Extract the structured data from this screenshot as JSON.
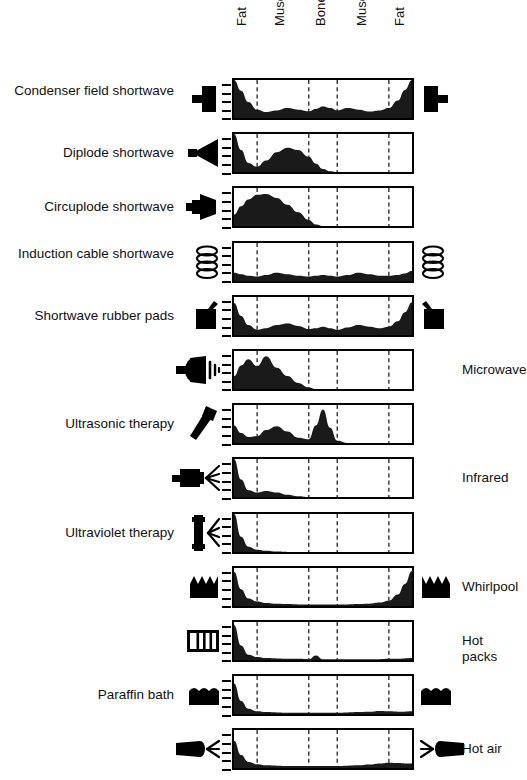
{
  "figure": {
    "axis_note": "depth-profile boxes with fat / muscle / bone / muscle / fat layers"
  },
  "tissue_layers": [
    {
      "label": "Fat",
      "start_pct": 0,
      "end_pct": 13
    },
    {
      "label": "Muscle",
      "start_pct": 13,
      "end_pct": 42
    },
    {
      "label": "Bone",
      "start_pct": 42,
      "end_pct": 58
    },
    {
      "label": "Muscle",
      "start_pct": 58,
      "end_pct": 87
    },
    {
      "label": "Fat",
      "start_pct": 87,
      "end_pct": 100
    }
  ],
  "colors": {
    "ink": "#000000",
    "fill": "#1a1a1a",
    "background": "#ffffff",
    "divider": "#333333"
  },
  "chart_data": {
    "type": "area",
    "xlabel": "Tissue depth (fat / muscle / bone / muscle / fat)",
    "ylabel": "Relative energy absorption",
    "xlim": [
      0,
      100
    ],
    "ylim": [
      0,
      1
    ],
    "grid": false,
    "legend_position": "none",
    "dividers_pct": [
      13,
      42,
      58,
      87
    ],
    "x": [
      0,
      4,
      8,
      13,
      18,
      24,
      30,
      36,
      42,
      46,
      50,
      54,
      58,
      64,
      70,
      76,
      82,
      87,
      92,
      96,
      100
    ],
    "series": [
      {
        "name": "Condenser field shortwave",
        "label_side": "left",
        "icon": "condenser-plate-icon",
        "icon_both_sides": true,
        "values": [
          1.0,
          0.72,
          0.42,
          0.22,
          0.16,
          0.2,
          0.26,
          0.22,
          0.18,
          0.24,
          0.3,
          0.26,
          0.2,
          0.26,
          0.22,
          0.17,
          0.2,
          0.26,
          0.46,
          0.74,
          1.0
        ]
      },
      {
        "name": "Diplode shortwave",
        "label_side": "left",
        "icon": "diplode-icon",
        "icon_both_sides": false,
        "values": [
          1.0,
          0.58,
          0.24,
          0.14,
          0.3,
          0.52,
          0.64,
          0.58,
          0.4,
          0.22,
          0.08,
          0.02,
          0.0,
          0.0,
          0.0,
          0.0,
          0.0,
          0.0,
          0.0,
          0.0,
          0.0
        ]
      },
      {
        "name": "Circuplode shortwave",
        "label_side": "left",
        "icon": "circuplode-icon",
        "icon_both_sides": false,
        "values": [
          0.3,
          0.52,
          0.7,
          0.82,
          0.84,
          0.74,
          0.56,
          0.36,
          0.16,
          0.04,
          0.0,
          0.0,
          0.0,
          0.0,
          0.0,
          0.0,
          0.0,
          0.0,
          0.0,
          0.0,
          0.0
        ]
      },
      {
        "name": "Induction cable shortwave",
        "label_side": "left",
        "icon": "coil-icon",
        "icon_both_sides": true,
        "values": [
          0.22,
          0.18,
          0.14,
          0.12,
          0.16,
          0.22,
          0.18,
          0.14,
          0.12,
          0.14,
          0.16,
          0.14,
          0.12,
          0.16,
          0.22,
          0.18,
          0.14,
          0.14,
          0.16,
          0.2,
          0.26
        ]
      },
      {
        "name": "Shortwave rubber pads",
        "label_side": "left",
        "icon": "rubber-pad-icon",
        "icon_both_sides": true,
        "values": [
          0.84,
          0.5,
          0.26,
          0.14,
          0.18,
          0.26,
          0.3,
          0.24,
          0.16,
          0.18,
          0.22,
          0.18,
          0.14,
          0.2,
          0.26,
          0.22,
          0.18,
          0.22,
          0.36,
          0.6,
          0.86
        ]
      },
      {
        "name": "Microwave",
        "label_side": "right",
        "icon": "microwave-emitter-icon",
        "icon_both_sides": false,
        "values": [
          0.34,
          0.62,
          0.78,
          0.6,
          0.86,
          0.56,
          0.34,
          0.16,
          0.04,
          0.0,
          0.0,
          0.0,
          0.0,
          0.0,
          0.0,
          0.0,
          0.0,
          0.0,
          0.0,
          0.0,
          0.0
        ]
      },
      {
        "name": "Ultrasonic therapy",
        "label_side": "left",
        "icon": "ultrasound-head-icon",
        "icon_both_sides": false,
        "values": [
          0.46,
          0.26,
          0.16,
          0.18,
          0.34,
          0.44,
          0.3,
          0.14,
          0.1,
          0.46,
          0.88,
          0.4,
          0.06,
          0.0,
          0.0,
          0.0,
          0.0,
          0.0,
          0.0,
          0.0,
          0.0
        ]
      },
      {
        "name": "Infrared",
        "label_side": "right",
        "icon": "infrared-lamp-icon",
        "icon_both_sides": false,
        "values": [
          1.0,
          0.46,
          0.18,
          0.12,
          0.16,
          0.12,
          0.06,
          0.02,
          0.0,
          0.0,
          0.0,
          0.0,
          0.0,
          0.0,
          0.0,
          0.0,
          0.0,
          0.0,
          0.0,
          0.0,
          0.0
        ]
      },
      {
        "name": "Ultraviolet therapy",
        "label_side": "left",
        "icon": "uv-lamp-icon",
        "icon_both_sides": false,
        "values": [
          1.0,
          0.4,
          0.14,
          0.06,
          0.03,
          0.01,
          0.0,
          0.0,
          0.0,
          0.0,
          0.0,
          0.0,
          0.0,
          0.0,
          0.0,
          0.0,
          0.0,
          0.0,
          0.0,
          0.0,
          0.0
        ]
      },
      {
        "name": "Whirlpool",
        "label_side": "right",
        "icon": "whirlpool-icon",
        "icon_both_sides": true,
        "values": [
          0.9,
          0.44,
          0.2,
          0.12,
          0.08,
          0.06,
          0.05,
          0.04,
          0.04,
          0.04,
          0.04,
          0.04,
          0.04,
          0.04,
          0.05,
          0.06,
          0.09,
          0.14,
          0.3,
          0.58,
          0.92
        ]
      },
      {
        "name": "Hot packs",
        "label_side": "right",
        "icon": "hot-pack-icon",
        "icon_both_sides": false,
        "values": [
          0.92,
          0.38,
          0.14,
          0.08,
          0.05,
          0.04,
          0.03,
          0.03,
          0.02,
          0.12,
          0.02,
          0.02,
          0.02,
          0.02,
          0.02,
          0.02,
          0.02,
          0.03,
          0.03,
          0.04,
          0.05
        ]
      },
      {
        "name": "Paraffin bath",
        "label_side": "left",
        "icon": "paraffin-bath-icon",
        "icon_both_sides": true,
        "values": [
          0.8,
          0.34,
          0.14,
          0.07,
          0.05,
          0.04,
          0.03,
          0.03,
          0.03,
          0.03,
          0.03,
          0.03,
          0.03,
          0.04,
          0.05,
          0.06,
          0.08,
          0.07,
          0.06,
          0.06,
          0.07
        ]
      },
      {
        "name": "Hot air",
        "label_side": "right",
        "icon": "hot-air-blower-icon",
        "icon_both_sides": true,
        "values": [
          0.72,
          0.34,
          0.16,
          0.1,
          0.07,
          0.06,
          0.05,
          0.05,
          0.05,
          0.05,
          0.05,
          0.05,
          0.05,
          0.06,
          0.07,
          0.09,
          0.12,
          0.14,
          0.13,
          0.12,
          0.12
        ]
      }
    ]
  }
}
